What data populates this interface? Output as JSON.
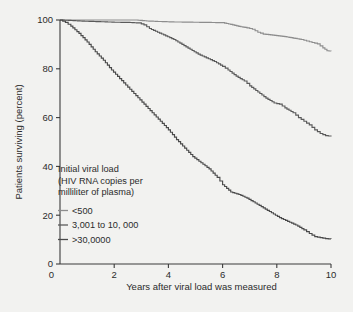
{
  "figure": {
    "background_color": "#f2f2f0"
  },
  "chart_data": {
    "type": "line",
    "title": "",
    "xlabel": "Years after viral load was measured",
    "ylabel": "Patients surviving (percent)",
    "xlim": [
      0,
      10
    ],
    "ylim": [
      0,
      100
    ],
    "xticks": [
      0,
      2,
      4,
      6,
      8,
      10
    ],
    "xtick_labels": [
      "0",
      "2",
      "4",
      "6",
      "8",
      "10"
    ],
    "yticks": [
      0,
      20,
      40,
      60,
      80,
      100
    ],
    "ytick_labels": [
      "0",
      "20",
      "40",
      "60",
      "80",
      "100"
    ],
    "grid": false,
    "legend_position": "inside-lower-left",
    "legend_title_lines": [
      "Initial viral load",
      "(HIV RNA copies per",
      "milliliter of plasma)"
    ],
    "series": [
      {
        "name": "<500",
        "color": "#8d8d8d",
        "x": [
          0,
          0.3,
          0.8,
          1.4,
          2.1,
          2.8,
          3.2,
          3.6,
          4.2,
          4.9,
          5.5,
          6.0,
          6.3,
          6.6,
          6.9,
          7.1,
          7.3,
          7.5,
          7.7,
          8.0,
          8.3,
          8.6,
          8.9,
          9.1,
          9.3,
          9.5,
          9.7,
          9.85,
          10.0
        ],
        "y": [
          100,
          100,
          100,
          100,
          100,
          100,
          99.6,
          99.4,
          99.2,
          99.1,
          99.0,
          98.9,
          98.2,
          97.4,
          96.8,
          96.2,
          95.0,
          94.2,
          94.0,
          93.6,
          93.2,
          92.6,
          92.0,
          91.4,
          90.8,
          90.2,
          88.6,
          87.4,
          87.2
        ]
      },
      {
        "name": "3,001 to 10, 000",
        "color": "#5a5a5a",
        "x": [
          0,
          0.4,
          0.9,
          1.5,
          2.0,
          2.5,
          2.9,
          3.1,
          3.3,
          3.6,
          3.9,
          4.2,
          4.5,
          4.8,
          5.1,
          5.4,
          5.7,
          6.0,
          6.2,
          6.5,
          6.8,
          7.0,
          7.3,
          7.6,
          7.9,
          8.1,
          8.3,
          8.6,
          8.8,
          9.0,
          9.2,
          9.4,
          9.6,
          9.8,
          10.0
        ],
        "y": [
          100,
          99.8,
          99.5,
          99.3,
          99.1,
          99.0,
          98.8,
          98.0,
          96.5,
          95.0,
          93.5,
          92.0,
          90.0,
          88.0,
          86.0,
          84.5,
          83.0,
          81.0,
          79.5,
          77.0,
          75.0,
          73.0,
          70.5,
          68.0,
          66.0,
          65.5,
          64.0,
          62.0,
          60.0,
          58.5,
          57.0,
          55.0,
          53.5,
          52.6,
          52.3
        ]
      },
      {
        "name": ">30,0000",
        "color": "#4a4a4a",
        "x": [
          0,
          0.2,
          0.4,
          0.7,
          1.0,
          1.3,
          1.6,
          1.9,
          2.2,
          2.5,
          2.8,
          3.1,
          3.4,
          3.7,
          4.0,
          4.3,
          4.6,
          4.9,
          5.2,
          5.5,
          5.8,
          6.0,
          6.3,
          6.6,
          6.9,
          7.2,
          7.5,
          7.8,
          8.1,
          8.4,
          8.7,
          9.0,
          9.2,
          9.4,
          9.6,
          9.8,
          10.0
        ],
        "y": [
          100,
          99.0,
          97.5,
          94.5,
          91.0,
          87.0,
          83.5,
          79.5,
          76.0,
          72.5,
          69.0,
          65.5,
          62.0,
          58.5,
          55.0,
          51.0,
          47.5,
          44.0,
          41.5,
          39.0,
          35.5,
          32.5,
          29.5,
          28.5,
          27.0,
          25.0,
          23.0,
          21.0,
          19.0,
          17.5,
          16.0,
          14.0,
          12.5,
          11.2,
          10.8,
          10.4,
          10.2
        ]
      }
    ]
  }
}
